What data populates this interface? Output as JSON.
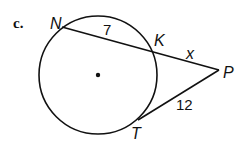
{
  "diagram": {
    "part_label": "c.",
    "points": {
      "N": "N",
      "K": "K",
      "P": "P",
      "T": "T"
    },
    "segments": {
      "NK": "7",
      "KP": "x",
      "TP": "12"
    }
  }
}
